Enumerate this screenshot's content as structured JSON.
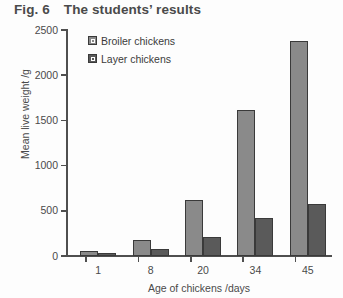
{
  "title": {
    "figure_number": "Fig. 6",
    "text": "The students’ results"
  },
  "chart_data": {
    "type": "bar",
    "title": "The students’ results",
    "xlabel": "Age of chickens /days",
    "ylabel": "Mean live weight /g",
    "categories": [
      "1",
      "8",
      "20",
      "34",
      "45"
    ],
    "series": [
      {
        "name": "Broiler chickens",
        "color": "#8a8a8a",
        "values": [
          55,
          175,
          620,
          1610,
          2380
        ]
      },
      {
        "name": "Layer chickens",
        "color": "#5a5a5a",
        "values": [
          35,
          80,
          205,
          420,
          575
        ]
      }
    ],
    "ylim": [
      0,
      2500
    ],
    "yticks": [
      0,
      500,
      1000,
      1500,
      2000,
      2500
    ],
    "ytick_labels": [
      "0",
      "500",
      "1000",
      "1500",
      "2000",
      "2500"
    ],
    "grid": false,
    "legend_position": "top-left-inside"
  },
  "colors": {
    "broiler": "#8a8a8a",
    "layer": "#5a5a5a",
    "axis": "#4f4f4f",
    "text": "#4a4a4a",
    "background": "#fdfdfd"
  }
}
